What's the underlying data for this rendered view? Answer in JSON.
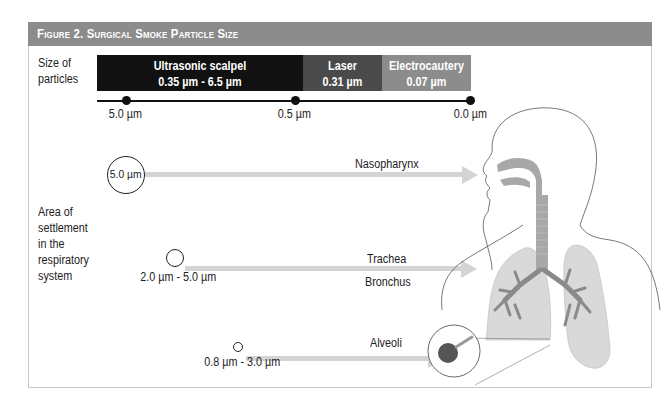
{
  "figure": {
    "title": "Figure 2.  Surgical Smoke Particle Size",
    "header_color": "#8c8c8c"
  },
  "size_section": {
    "label_line1": "Size of",
    "label_line2": "particles",
    "bars": [
      {
        "name": "Ultrasonic scalpel",
        "range": "0.35 µm - 6.5 µm",
        "color": "#111111"
      },
      {
        "name": "Laser",
        "range": "0.31 µm",
        "color": "#4a4a4a"
      },
      {
        "name": "Electrocautery",
        "range": "0.07 µm",
        "color": "#8c8c8c"
      }
    ],
    "scale_ticks": [
      "5.0 µm",
      "0.5 µm",
      "0.0 µm"
    ]
  },
  "settlement_section": {
    "label_lines": [
      "Area of",
      "settlement",
      "in the",
      "respiratory",
      "system"
    ],
    "particles": [
      {
        "size": "5.0 µm",
        "region": "Nasopharynx"
      },
      {
        "size": "2.0 µm - 5.0 µm",
        "region_line1": "Trachea",
        "region_line2": "Bronchus"
      },
      {
        "size": "0.8 µm - 3.0 µm",
        "region": "Alveoli"
      }
    ]
  },
  "illustration": {
    "subject": "human respiratory system",
    "airway_color": "#a8a8a8",
    "lung_color": "#d9d9d9"
  }
}
